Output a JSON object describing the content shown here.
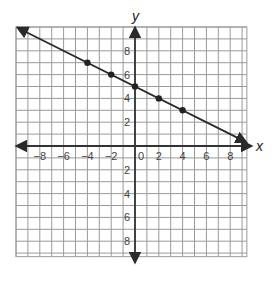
{
  "chart_data": {
    "type": "line",
    "title": "",
    "xlabel": "x",
    "ylabel": "y",
    "xlim": [
      -10,
      9.4
    ],
    "ylim": [
      -9.3,
      10
    ],
    "grid": true,
    "grid_step": 1,
    "x_ticks": [
      -8,
      -6,
      -4,
      -2,
      0,
      2,
      4,
      6,
      8
    ],
    "y_ticks": [
      8,
      6,
      4,
      2,
      -2,
      -4,
      -6,
      -8
    ],
    "x_tick_labels": [
      "-8",
      "-6",
      "-4",
      "-2",
      "0",
      "2",
      "4",
      "6",
      "8"
    ],
    "y_tick_labels": [
      "8",
      "6",
      "4",
      "2",
      "2",
      "4",
      "6",
      "8"
    ],
    "line": {
      "slope": -0.5,
      "intercept": 5,
      "from": [
        -10,
        10
      ],
      "to": [
        9.3,
        0.35
      ],
      "arrows": "both"
    },
    "points": [
      {
        "x": -4,
        "y": 7
      },
      {
        "x": -2,
        "y": 6
      },
      {
        "x": 0,
        "y": 5
      },
      {
        "x": 2,
        "y": 4
      },
      {
        "x": 4,
        "y": 3
      }
    ],
    "colors": {
      "grid": "#9a9a9a",
      "axis": "#333333",
      "line": "#2a2a2a",
      "point": "#222222"
    }
  }
}
